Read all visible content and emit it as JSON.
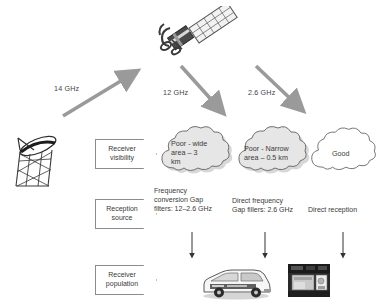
{
  "diagram": {
    "uplink": {
      "label": "14 GHz",
      "name": "uplink-14ghz"
    },
    "downlinks": [
      {
        "label": "12 GHz",
        "name": "downlink-12ghz"
      },
      {
        "label": "2.6 GHz",
        "name": "downlink-26ghz"
      }
    ],
    "row_labels": [
      {
        "line1": "Receiver",
        "line2": "visibility",
        "text": "Receiver\nvisibility"
      },
      {
        "line1": "Reception",
        "line2": "source",
        "text": "Reception\nsource"
      },
      {
        "line1": "Receiver",
        "line2": "population",
        "text": "Receiver\npopulation"
      }
    ],
    "clouds": [
      {
        "text": "Poor - wide\narea – 3\nkm",
        "shaded": true,
        "name": "cloud-poor-wide-area"
      },
      {
        "text": "Poor - Narrow\narea – 0.5 km",
        "shaded": true,
        "name": "cloud-poor-narrow-area"
      },
      {
        "text": "Good",
        "shaded": false,
        "name": "cloud-good"
      }
    ],
    "reception_sources": [
      {
        "text": "Frequency\nconversion Gap\nfilters: 12–2.6 GHz",
        "name": "source-frequency-conversion"
      },
      {
        "text": "Direct frequency\nGap fillers: 2.6 GHz",
        "name": "source-direct-frequency"
      },
      {
        "text": "Direct reception",
        "name": "source-direct-reception"
      }
    ],
    "icons": {
      "satellite": "satellite-icon",
      "ground_station": "ground-station-dish-icon",
      "van": "receiver-van-photo",
      "building": "receiver-building-photo"
    },
    "colors": {
      "arrow_gray": "#9a9a9a",
      "cloud_fill": "#e3e3e3",
      "cloud_white": "#ffffff",
      "cloud_stroke": "#777777",
      "text": "#3a3a3a",
      "box_stroke": "#8b8b8b"
    }
  }
}
